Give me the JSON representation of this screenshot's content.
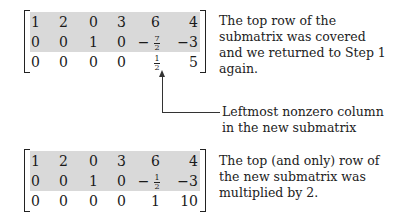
{
  "matrix1": {
    "rows": [
      [
        "1",
        "2",
        "0",
        "3",
        "6",
        "4"
      ],
      [
        "0",
        "0",
        "1",
        "0",
        "−7/2",
        "−3"
      ],
      [
        "0",
        "0",
        "0",
        "0",
        "1/2",
        "5"
      ]
    ],
    "shaded_rows": [
      0,
      1
    ]
  },
  "note1": "The top row of the submatrix was covered and we returned to Step 1 again.",
  "annotation": "Leftmost nonzero column in the new submatrix",
  "matrix2": {
    "rows": [
      [
        "1",
        "2",
        "0",
        "3",
        "6",
        "4"
      ],
      [
        "0",
        "0",
        "1",
        "0",
        "−1/2",
        "−3"
      ],
      [
        "0",
        "0",
        "0",
        "0",
        "1",
        "10"
      ]
    ],
    "shaded_rows": [
      0,
      1
    ]
  },
  "note2": "The top (and only) row of the new submatrix was multiplied by 2.",
  "colors": {
    "shade": "#d9d9d9",
    "ink": "#1a1a1a"
  }
}
